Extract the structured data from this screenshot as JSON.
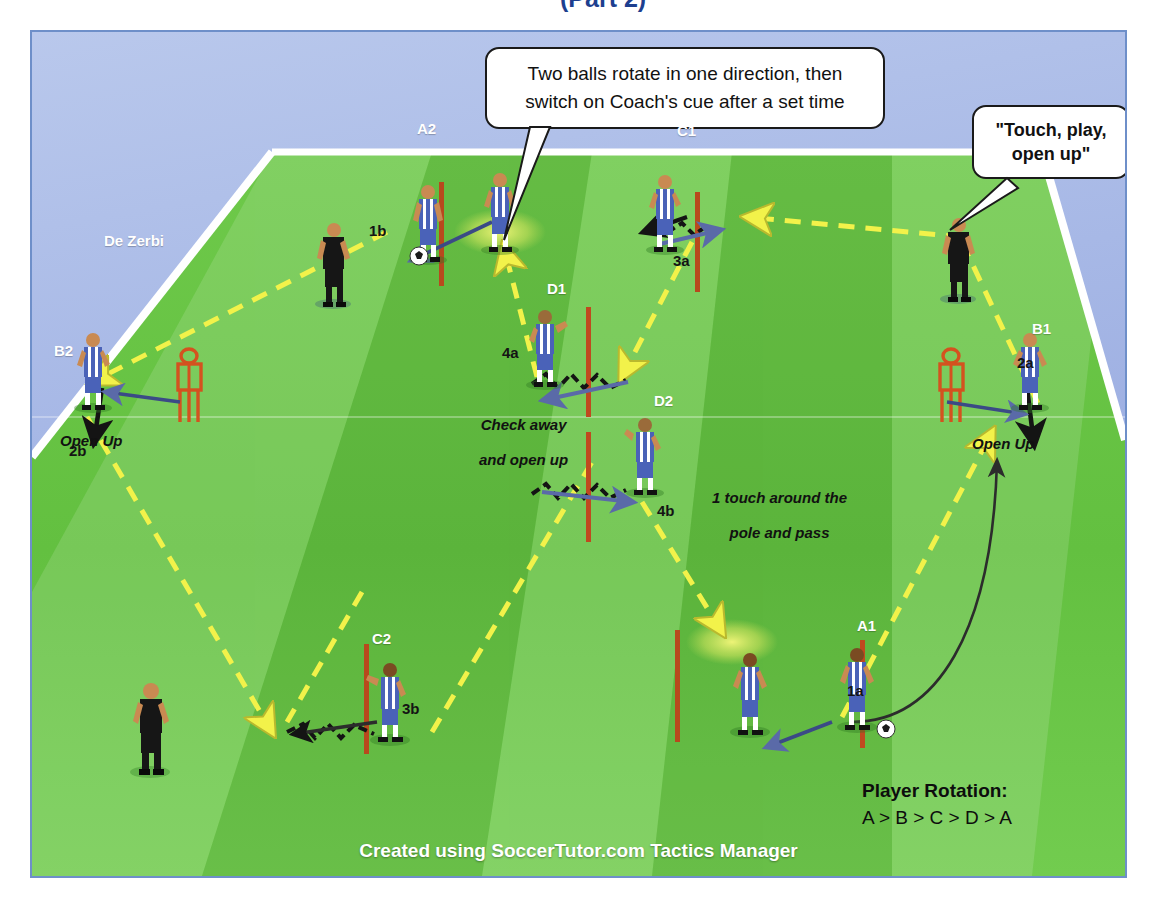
{
  "document": {
    "title_fragment": "(Part 2)",
    "footer": "Created using SoccerTutor.com Tactics Manager"
  },
  "callouts": [
    {
      "name": "main-instruction",
      "line1": "Two balls rotate in one direction, then",
      "line2": "switch on Coach's cue after a set time"
    },
    {
      "name": "coach-cue",
      "line1": "\"Touch, play,",
      "line2": "open up\""
    }
  ],
  "coach": {
    "name_label": "De Zerbi"
  },
  "player_labels": [
    {
      "id": "A2",
      "text": "A2"
    },
    {
      "id": "C1",
      "text": "C1"
    },
    {
      "id": "B2",
      "text": "B2"
    },
    {
      "id": "B1",
      "text": "B1"
    },
    {
      "id": "D1",
      "text": "D1"
    },
    {
      "id": "D2",
      "text": "D2"
    },
    {
      "id": "C2",
      "text": "C2"
    },
    {
      "id": "A1",
      "text": "A1"
    }
  ],
  "sequence_labels": [
    {
      "id": "1a",
      "text": "1a"
    },
    {
      "id": "1b",
      "text": "1b"
    },
    {
      "id": "2a",
      "text": "2a"
    },
    {
      "id": "2b",
      "text": "2b"
    },
    {
      "id": "3a",
      "text": "3a"
    },
    {
      "id": "3b",
      "text": "3b"
    },
    {
      "id": "4a",
      "text": "4a"
    },
    {
      "id": "4b",
      "text": "4b"
    }
  ],
  "annotations": [
    {
      "id": "open-up-left",
      "text": "Open Up"
    },
    {
      "id": "open-up-right",
      "text": "Open Up"
    },
    {
      "id": "check-away",
      "line1": "Check away",
      "line2": "and open up"
    },
    {
      "id": "one-touch",
      "line1": "1 touch around the",
      "line2": "pole and pass"
    }
  ],
  "rotation": {
    "title": "Player Rotation:",
    "sequence": "A > B > C > D > A"
  },
  "colors": {
    "pitch_green": "#63c040",
    "background_blue": "#a7b8e6",
    "pass_arrow_yellow": "#f2f24a",
    "run_arrow_dark": "#1a1a1a",
    "movement_arrow_blue": "#5a6aa8",
    "pole_red": "#c0491f",
    "mannequin_orange": "#d4521f",
    "kit_blue": "#4a62b8",
    "coach_black": "#1a1a1a",
    "line_white": "#ffffff",
    "border_blue": "#6e8fc9"
  }
}
